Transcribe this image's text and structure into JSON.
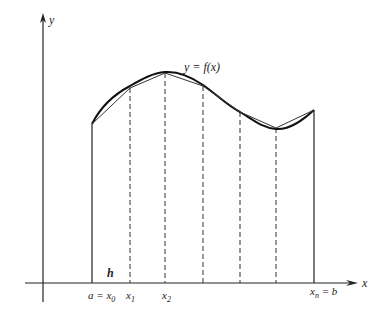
{
  "figure": {
    "type": "trapezoidal-rule-diagram",
    "axes": {
      "x_label": "x",
      "y_label": "y"
    },
    "curve_label": "y = f(x)",
    "step_label": "h",
    "partition_labels": {
      "x0": "a = x",
      "x0_sub": "0",
      "x1": "x",
      "x1_sub": "1",
      "x2": "x",
      "x2_sub": "2",
      "xn": "x",
      "xn_sub": "n",
      "xn_suffix": " = b"
    },
    "nodes": [
      {
        "x": 92,
        "y": 124
      },
      {
        "x": 130,
        "y": 88
      },
      {
        "x": 165,
        "y": 73
      },
      {
        "x": 203,
        "y": 86
      },
      {
        "x": 240,
        "y": 112
      },
      {
        "x": 276,
        "y": 128
      },
      {
        "x": 314,
        "y": 110
      }
    ],
    "colors": {
      "stroke": "#222222",
      "background": "#ffffff"
    }
  }
}
